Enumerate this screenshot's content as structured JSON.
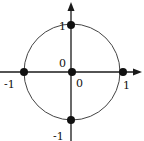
{
  "diagram": {
    "type": "unit-circle-with-axes",
    "colors": {
      "stroke": "#1a1a1a",
      "circle": "#444444",
      "dot": "#111111",
      "background": "#ffffff"
    },
    "labels": {
      "top": "1",
      "bottom": "-1",
      "left": "-1",
      "right": "1",
      "origin_upper": "0",
      "origin_lower": "0"
    },
    "points": [
      {
        "name": "top",
        "coords": [
          0,
          1
        ]
      },
      {
        "name": "bottom",
        "coords": [
          0,
          -1
        ]
      },
      {
        "name": "left",
        "coords": [
          -1,
          0
        ]
      },
      {
        "name": "right",
        "coords": [
          1,
          0
        ]
      },
      {
        "name": "origin",
        "coords": [
          0,
          0
        ]
      }
    ]
  }
}
